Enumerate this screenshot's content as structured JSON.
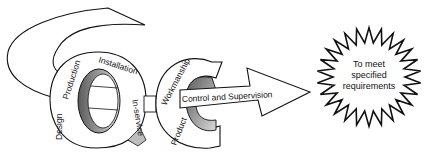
{
  "diagram": {
    "type": "quality-control-concept",
    "letters": [
      "Q",
      "C"
    ],
    "q_ring_labels": [
      "Design",
      "Production",
      "Installation",
      "In-service"
    ],
    "c_ring_labels": [
      "Product",
      "Workmanship"
    ],
    "arrow_label": "Control and Supervision",
    "starburst": {
      "line1": "To meet",
      "line2": "specified",
      "line3": "requirements"
    },
    "colors": {
      "stroke": "#111111",
      "fill": "#ffffff",
      "shade_dark": "#6a6a6a",
      "shade_light": "#d8d8d8"
    }
  }
}
